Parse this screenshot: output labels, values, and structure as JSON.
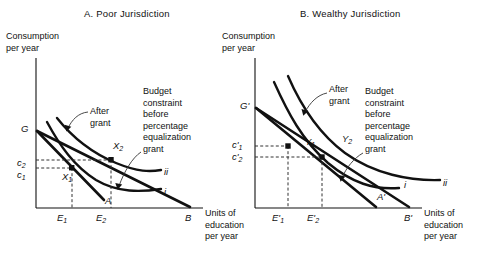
{
  "figure": {
    "panels": [
      {
        "id": "A",
        "title": "A.  Poor Jurisdiction",
        "y_axis_caption": "Consumption\nper year",
        "x_axis_caption": "Units of\neducation\nper year",
        "annotation_after_grant": "After\ngrant",
        "annotation_budget": "Budget\nconstraint\nbefore\npercentage\nequalization\ngrant",
        "y_intercept_label": "G",
        "x_intercept_label": "B",
        "consumption_ticks": [
          "c2",
          "c1"
        ],
        "education_ticks": [
          "E1",
          "E2"
        ],
        "equilibrium_points": [
          "X1",
          "X2"
        ],
        "tangency_point": "A",
        "indifference_curves": [
          "i",
          "ii"
        ]
      },
      {
        "id": "B",
        "title": "B.  Wealthy Jurisdiction",
        "y_axis_caption": "Consumption\nper year",
        "x_axis_caption": "Units of\neducation\nper year",
        "annotation_after_grant": "After\ngrant",
        "annotation_budget": "Budget\nconstraint\nbefore\npercentage\nequalization\ngrant",
        "y_intercept_label": "G'",
        "x_intercept_label": "B'",
        "consumption_ticks": [
          "c'1",
          "c'2"
        ],
        "education_ticks": [
          "E'1",
          "E'2"
        ],
        "equilibrium_points": [
          "Y1",
          "Y2"
        ],
        "tangency_point": "A'",
        "indifference_curves": [
          "i",
          "ii"
        ]
      }
    ],
    "colors": {
      "ink": "#111111",
      "background": "#ffffff",
      "dashed_guide": "#555555"
    }
  },
  "chart_data": {
    "type": "line",
    "xlabel": "Units of education per year",
    "ylabel": "Consumption per year",
    "panels": [
      {
        "name": "A. Poor Jurisdiction",
        "series": [
          {
            "name": "Budget constraint before percentage equalization grant",
            "type": "line",
            "points": [
              [
                0,
                150
              ],
              [
                164,
                0
              ]
            ],
            "endpoint_labels": [
              "G",
              "B"
            ]
          },
          {
            "name": "Budget constraint after grant",
            "type": "line",
            "points": [
              [
                0,
                150
              ],
              [
                95,
                0
              ]
            ],
            "endpoint_labels": [
              "G",
              "A"
            ]
          },
          {
            "name": "Indifference curve i",
            "type": "curve",
            "label": "i",
            "tangent_point": "X1"
          },
          {
            "name": "Indifference curve ii",
            "type": "curve",
            "label": "ii",
            "tangent_point": "X2"
          }
        ],
        "points": [
          {
            "label": "X1",
            "x": 54,
            "y": 70,
            "x_tick": "E1",
            "y_tick": "c1"
          },
          {
            "label": "X2",
            "x": 110,
            "y": 78,
            "x_tick": "E2",
            "y_tick": "c2"
          }
        ]
      },
      {
        "name": "B. Wealthy Jurisdiction",
        "series": [
          {
            "name": "Budget constraint before percentage equalization grant",
            "type": "line",
            "points": [
              [
                0,
                150
              ],
              [
                170,
                0
              ]
            ],
            "endpoint_labels": [
              "G'",
              "B'"
            ]
          },
          {
            "name": "Budget constraint after grant",
            "type": "line",
            "points": [
              [
                0,
                150
              ],
              [
                110,
                0
              ]
            ],
            "endpoint_labels": [
              "G'",
              "A'"
            ]
          },
          {
            "name": "Indifference curve i",
            "type": "curve",
            "label": "i",
            "tangent_point": "Y1"
          },
          {
            "name": "Indifference curve ii",
            "type": "curve",
            "label": "ii",
            "tangent_point": "Y2"
          }
        ],
        "points": [
          {
            "label": "Y1",
            "x": 57,
            "y": 82,
            "x_tick": "E'1",
            "y_tick": "c'1"
          },
          {
            "label": "Y2",
            "x": 83,
            "y": 74,
            "x_tick": "E'2",
            "y_tick": "c'2"
          }
        ]
      }
    ],
    "grid": false,
    "legend": "none"
  }
}
